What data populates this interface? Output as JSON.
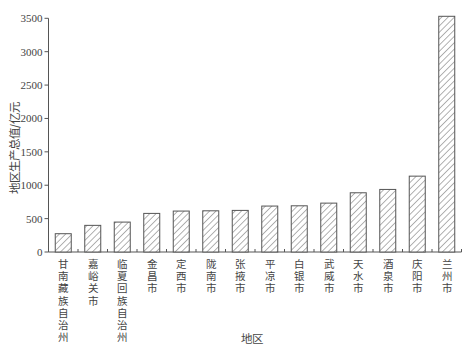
{
  "chart_data": {
    "type": "bar",
    "title": "",
    "xlabel": "地区",
    "ylabel": "地区生产总值/亿元",
    "ylim": [
      0,
      3500
    ],
    "yticks": [
      0,
      500,
      1000,
      1500,
      2000,
      2500,
      3000,
      3500
    ],
    "grid": false,
    "legend": null,
    "bar_style": {
      "fill": "hatch-diagonal",
      "stroke": "#555555",
      "hatch_color": "#666666"
    },
    "categories": [
      "甘南藏族自治州",
      "嘉峪关市",
      "临夏回族自治州",
      "金昌市",
      "定西市",
      "陇南市",
      "张掖市",
      "平凉市",
      "白银市",
      "武威市",
      "天水市",
      "酒泉市",
      "庆阳市",
      "兰州市"
    ],
    "values": [
      274,
      399,
      448,
      578,
      613,
      617,
      623,
      688,
      692,
      732,
      887,
      937,
      1136,
      3530
    ]
  }
}
